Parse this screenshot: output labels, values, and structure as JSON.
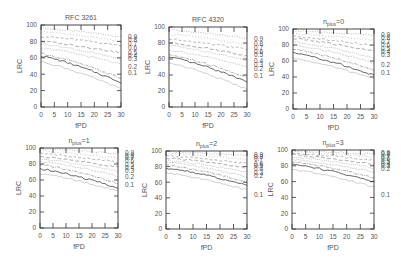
{
  "chart_data": [
    {
      "type": "line",
      "title": "RFC 3261",
      "xlabel": "fPD",
      "ylabel": "LRC",
      "xlim": [
        0,
        30
      ],
      "ylim": [
        0,
        100
      ],
      "xticks": [
        0,
        5,
        10,
        15,
        20,
        25,
        30
      ],
      "yticks": [
        0,
        20,
        40,
        60,
        80,
        100
      ],
      "box": {
        "x0": 41,
        "x1": 121,
        "y0": 25,
        "y1": 107
      },
      "legend_position": "right-of-plot",
      "series": [
        {
          "name": "0.9",
          "start": 96,
          "end": 86,
          "label_y": 86
        },
        {
          "name": "0.8",
          "start": 92,
          "end": 80,
          "label_y": 82
        },
        {
          "name": "0.7",
          "start": 86,
          "end": 75,
          "label_y": 78
        },
        {
          "name": "0.6",
          "start": 80,
          "end": 66,
          "label_y": 73
        },
        {
          "name": "0.5",
          "start": 77,
          "end": 58,
          "label_y": 67
        },
        {
          "name": "0.4",
          "start": 72,
          "end": 52,
          "label_y": 63
        },
        {
          "name": "0.3",
          "start": 65,
          "end": 35,
          "label_y": 59
        },
        {
          "name": "0.2",
          "start": 62,
          "end": 30,
          "label_y": 50
        },
        {
          "name": "0.1",
          "start": 55,
          "end": 22,
          "label_y": 42
        }
      ]
    },
    {
      "type": "line",
      "title": "RFC 4320",
      "xlabel": "fPD",
      "ylabel": "LRC",
      "xlim": [
        0,
        30
      ],
      "ylim": [
        0,
        100
      ],
      "xticks": [
        0,
        5,
        10,
        15,
        20,
        25,
        30
      ],
      "yticks": [
        0,
        20,
        40,
        60,
        80,
        100
      ],
      "box": {
        "x0": 169,
        "x1": 247,
        "y0": 27,
        "y1": 107
      },
      "legend_position": "right-of-plot",
      "series": [
        {
          "name": "0.9",
          "start": 96,
          "end": 86,
          "label_y": 86
        },
        {
          "name": "0.8",
          "start": 91,
          "end": 78,
          "label_y": 80
        },
        {
          "name": "0.7",
          "start": 85,
          "end": 72,
          "label_y": 75
        },
        {
          "name": "0.6",
          "start": 80,
          "end": 64,
          "label_y": 70
        },
        {
          "name": "0.5",
          "start": 77,
          "end": 58,
          "label_y": 66
        },
        {
          "name": "0.4",
          "start": 71,
          "end": 50,
          "label_y": 58
        },
        {
          "name": "0.3",
          "start": 65,
          "end": 37,
          "label_y": 53
        },
        {
          "name": "0.2",
          "start": 62,
          "end": 32,
          "label_y": 48
        },
        {
          "name": "0.1",
          "start": 55,
          "end": 22,
          "label_y": 40
        }
      ]
    },
    {
      "type": "line",
      "title": "n_plus=0",
      "title_main": "n",
      "title_sub": "plus",
      "title_rest": "=0",
      "xlabel": "fPD",
      "ylabel": "LRC",
      "xlim": [
        0,
        30
      ],
      "ylim": [
        0,
        100
      ],
      "xticks": [
        0,
        5,
        10,
        15,
        20,
        25,
        30
      ],
      "yticks": [
        0,
        20,
        40,
        60,
        80,
        100
      ],
      "box": {
        "x0": 293,
        "x1": 374,
        "y0": 29,
        "y1": 109
      },
      "legend_position": "right-of-plot",
      "series": [
        {
          "name": "0.9",
          "start": 98,
          "end": 92,
          "label_y": 93
        },
        {
          "name": "0.8",
          "start": 94,
          "end": 86,
          "label_y": 89
        },
        {
          "name": "0.7",
          "start": 91,
          "end": 79,
          "label_y": 85
        },
        {
          "name": "0.6",
          "start": 88,
          "end": 72,
          "label_y": 81
        },
        {
          "name": "0.5",
          "start": 84,
          "end": 64,
          "label_y": 76
        },
        {
          "name": "0.4",
          "start": 80,
          "end": 58,
          "label_y": 72
        },
        {
          "name": "0.3",
          "start": 75,
          "end": 48,
          "label_y": 68
        },
        {
          "name": "0.2",
          "start": 70,
          "end": 42,
          "label_y": 56
        },
        {
          "name": "0.1",
          "start": 63,
          "end": 38,
          "label_y": 46
        }
      ]
    },
    {
      "type": "line",
      "title": "n_plus=1",
      "title_main": "n",
      "title_sub": "plus",
      "title_rest": "=1",
      "xlabel": "fPD",
      "ylabel": "LRC",
      "xlim": [
        0,
        30
      ],
      "ylim": [
        0,
        100
      ],
      "xticks": [
        0,
        5,
        10,
        15,
        20,
        25,
        30
      ],
      "yticks": [
        0,
        20,
        40,
        60,
        80,
        100
      ],
      "box": {
        "x0": 40,
        "x1": 118,
        "y0": 148,
        "y1": 228
      },
      "legend_position": "right-of-plot",
      "series": [
        {
          "name": "0.9",
          "start": 99,
          "end": 93,
          "label_y": 95
        },
        {
          "name": "0.8",
          "start": 96,
          "end": 87,
          "label_y": 91
        },
        {
          "name": "0.7",
          "start": 93,
          "end": 82,
          "label_y": 88
        },
        {
          "name": "0.6",
          "start": 89,
          "end": 76,
          "label_y": 84
        },
        {
          "name": "0.5",
          "start": 86,
          "end": 71,
          "label_y": 80
        },
        {
          "name": "0.4",
          "start": 83,
          "end": 65,
          "label_y": 76
        },
        {
          "name": "0.3",
          "start": 79,
          "end": 56,
          "label_y": 72
        },
        {
          "name": "0.2",
          "start": 74,
          "end": 50,
          "label_y": 64
        },
        {
          "name": "0.1",
          "start": 68,
          "end": 46,
          "label_y": 55
        }
      ]
    },
    {
      "type": "line",
      "title": "n_plus=2",
      "title_main": "n",
      "title_sub": "plus",
      "title_rest": "=2",
      "xlabel": "fPD",
      "ylabel": "LRC",
      "xlim": [
        0,
        30
      ],
      "ylim": [
        0,
        100
      ],
      "xticks": [
        0,
        5,
        10,
        15,
        20,
        25,
        30
      ],
      "yticks": [
        0,
        20,
        40,
        60,
        80,
        100
      ],
      "box": {
        "x0": 166,
        "x1": 247,
        "y0": 151,
        "y1": 229
      },
      "legend_position": "right-of-plot",
      "series": [
        {
          "name": "0.9",
          "start": 99,
          "end": 94,
          "label_y": 96
        },
        {
          "name": "0.8",
          "start": 97,
          "end": 89,
          "label_y": 93
        },
        {
          "name": "0.7",
          "start": 94,
          "end": 84,
          "label_y": 90
        },
        {
          "name": "0.6",
          "start": 91,
          "end": 78,
          "label_y": 84
        },
        {
          "name": "0.5",
          "start": 88,
          "end": 73,
          "label_y": 81
        },
        {
          "name": "0.4",
          "start": 86,
          "end": 67,
          "label_y": 77
        },
        {
          "name": "0.3",
          "start": 82,
          "end": 60,
          "label_y": 73
        },
        {
          "name": "0.2",
          "start": 78,
          "end": 56,
          "label_y": 69
        },
        {
          "name": "0.1",
          "start": 72,
          "end": 50,
          "label_y": 44
        }
      ]
    },
    {
      "type": "line",
      "title": "n_plus=3",
      "title_main": "n",
      "title_sub": "plus",
      "title_rest": "=3",
      "xlabel": "fPD",
      "ylabel": "LRC",
      "xlim": [
        0,
        30
      ],
      "ylim": [
        0,
        100
      ],
      "xticks": [
        0,
        5,
        10,
        15,
        20,
        25,
        30
      ],
      "yticks": [
        0,
        20,
        40,
        60,
        80,
        100
      ],
      "box": {
        "x0": 292,
        "x1": 374,
        "y0": 150,
        "y1": 229
      },
      "legend_position": "right-of-plot",
      "series": [
        {
          "name": "0.9",
          "start": 99,
          "end": 95,
          "label_y": 97
        },
        {
          "name": "0.8",
          "start": 98,
          "end": 91,
          "label_y": 95
        },
        {
          "name": "0.7",
          "start": 96,
          "end": 87,
          "label_y": 92
        },
        {
          "name": "0.6",
          "start": 94,
          "end": 82,
          "label_y": 89
        },
        {
          "name": "0.5",
          "start": 91,
          "end": 77,
          "label_y": 86
        },
        {
          "name": "0.4",
          "start": 88,
          "end": 72,
          "label_y": 83
        },
        {
          "name": "0.3",
          "start": 85,
          "end": 65,
          "label_y": 80
        },
        {
          "name": "0.2",
          "start": 82,
          "end": 60,
          "label_y": 76
        },
        {
          "name": "0.1",
          "start": 75,
          "end": 53,
          "label_y": 44
        }
      ]
    }
  ]
}
